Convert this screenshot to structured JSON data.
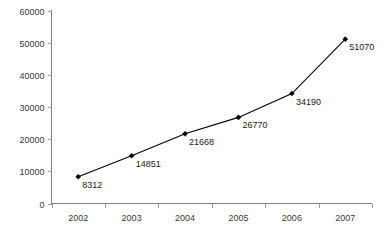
{
  "chart_data": {
    "type": "line",
    "title": "",
    "subtitle": "",
    "xlabel": "",
    "ylabel": "",
    "categories": [
      "2002",
      "2003",
      "2004",
      "2005",
      "2006",
      "2007"
    ],
    "values": [
      8312,
      14851,
      21668,
      26770,
      34190,
      51070
    ],
    "point_labels": [
      "8312",
      "14851",
      "21668",
      "26770",
      "34190",
      "51070"
    ],
    "series": [
      {
        "name": "",
        "values": [
          8312,
          14851,
          21668,
          26770,
          34190,
          51070
        ],
        "marker": "diamond",
        "color": "#000000"
      }
    ],
    "ylim": [
      0,
      60000
    ],
    "y_ticks": [
      0,
      10000,
      20000,
      30000,
      40000,
      50000,
      60000
    ],
    "y_tick_labels": [
      "0",
      "10000",
      "20000",
      "30000",
      "40000",
      "50000",
      "60000"
    ],
    "x_tick_labels": [
      "2002",
      "2003",
      "2004",
      "2005",
      "2006",
      "2007"
    ],
    "grid": false,
    "legend": false,
    "legend_position": "none",
    "line_color": "#000000",
    "axis_color": "#808080",
    "background_color": "#ffffff"
  }
}
